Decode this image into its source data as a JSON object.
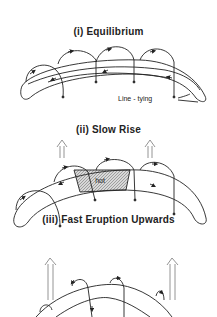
{
  "panels": [
    {
      "title": "(i) Equilibrium",
      "annotation": "Line - tying"
    },
    {
      "title": "(ii) Slow Rise",
      "region_label": "hot"
    },
    {
      "title": "(iii) Fast Eruption Upwards"
    }
  ],
  "colors": {
    "stroke": "#222222",
    "hatch": "#999999",
    "background": "#ffffff"
  }
}
